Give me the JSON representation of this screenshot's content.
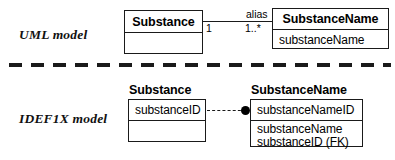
{
  "diagram": {
    "background": "#ffffff",
    "line_color": "#1a1a1a"
  },
  "uml_section": {
    "caption": "UML model",
    "classes": [
      {
        "name": "Substance",
        "attributes": [],
        "empty_compartment": ""
      },
      {
        "name": "SubstanceName",
        "attributes": [
          "substanceName"
        ]
      }
    ],
    "association": {
      "label": "alias",
      "source_multiplicity": "1",
      "target_multiplicity": "1..*"
    }
  },
  "idef1x_section": {
    "caption": "IDEF1X model",
    "entities": [
      {
        "name": "Substance",
        "keys": [
          "substanceID"
        ],
        "attributes": [],
        "empty_compartment": ""
      },
      {
        "name": "SubstanceName",
        "keys": [
          "substanceNameID"
        ],
        "attributes": [
          "substanceName",
          "substanceID (FK)"
        ]
      }
    ],
    "relationship": {
      "style": "dashed-non-identifying",
      "terminator": "filled-circle"
    }
  }
}
